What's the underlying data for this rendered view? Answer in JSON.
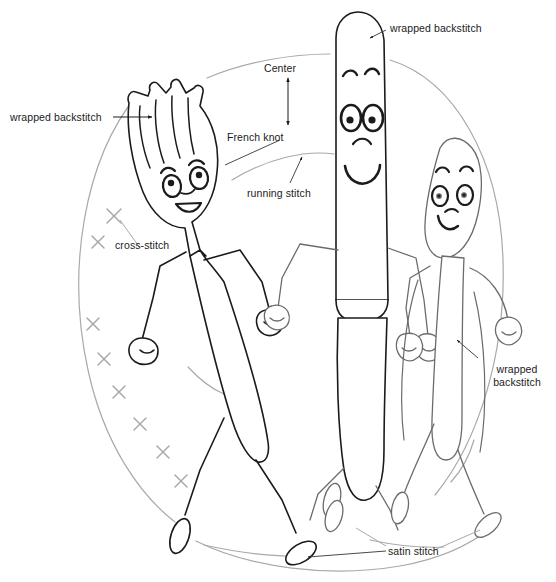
{
  "diagram": {
    "type": "line-art-embroidery-pattern",
    "canvas": {
      "width": 556,
      "height": 582,
      "background": "#ffffff"
    },
    "colors": {
      "ink_dark": "#1b1b1b",
      "ink_mid": "#4a4a4a",
      "ink_light": "#9a9a9a",
      "leader_line": "#6b6b6b",
      "text": "#1b1b1b"
    }
  },
  "labels": [
    {
      "id": "wrapped-backstitch-fork",
      "text": "wrapped backstitch",
      "x": 10,
      "y": 112,
      "lines": [
        "wrapped backstitch"
      ]
    },
    {
      "id": "wrapped-backstitch-knife",
      "text": "wrapped backstitch",
      "x": 390,
      "y": 22,
      "lines": [
        "wrapped backstitch"
      ]
    },
    {
      "id": "wrapped-backstitch-spoon",
      "text": "wrapped backstitch",
      "x": 481,
      "y": 363,
      "lines": [
        "wrapped",
        "backstitch"
      ]
    },
    {
      "id": "center",
      "text": "Center",
      "x": 264,
      "y": 63,
      "lines": [
        "Center"
      ]
    },
    {
      "id": "french-knot",
      "text": "French knot",
      "x": 227,
      "y": 131,
      "lines": [
        "French knot"
      ]
    },
    {
      "id": "running-stitch",
      "text": "running stitch",
      "x": 247,
      "y": 187,
      "lines": [
        "running stitch"
      ]
    },
    {
      "id": "cross-stitch",
      "text": "cross-stitch",
      "x": 115,
      "y": 239,
      "lines": [
        "cross-stitch"
      ]
    },
    {
      "id": "satin-stitch",
      "text": "satin stitch",
      "x": 388,
      "y": 549,
      "lines": [
        "satin stitch"
      ]
    }
  ],
  "characters": [
    {
      "id": "fork",
      "name": "fork character",
      "tines": 4,
      "expression": "smiling",
      "pose": "walking-left"
    },
    {
      "id": "knife",
      "name": "knife character",
      "expression": "big-smile",
      "pose": "standing-center"
    },
    {
      "id": "spoon",
      "name": "spoon character",
      "expression": "smiling",
      "pose": "walking-right"
    }
  ],
  "stitch_marks": {
    "cross_stitch_count": 8,
    "cross_stitch_positions": [
      [
        114,
        216
      ],
      [
        98,
        242
      ],
      [
        93,
        324
      ],
      [
        104,
        359
      ],
      [
        119,
        392
      ],
      [
        140,
        424
      ],
      [
        163,
        452
      ],
      [
        181,
        481
      ]
    ]
  }
}
